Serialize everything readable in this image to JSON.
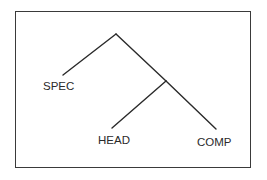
{
  "diagram": {
    "type": "x-bar syntax tree",
    "nodes": {
      "root": {
        "label": ""
      },
      "intermediate": {
        "label": ""
      },
      "spec": {
        "label": "SPEC"
      },
      "head": {
        "label": "HEAD"
      },
      "comp": {
        "label": "COMP"
      }
    },
    "edges": [
      {
        "from": "root",
        "to": "spec"
      },
      {
        "from": "root",
        "to": "intermediate"
      },
      {
        "from": "intermediate",
        "to": "head"
      },
      {
        "from": "intermediate",
        "to": "comp"
      }
    ],
    "colors": {
      "line": "#2a2a2a",
      "text": "#2a2a2a",
      "border": "#3a3a3a",
      "background": "#ffffff"
    }
  }
}
